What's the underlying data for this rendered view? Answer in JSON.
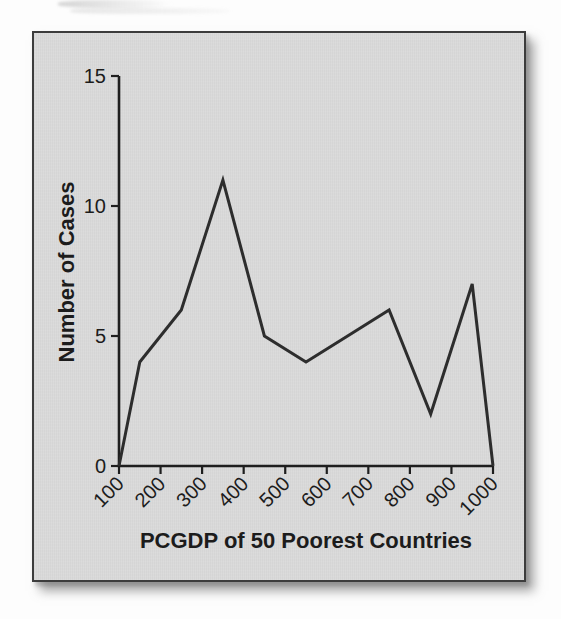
{
  "figure": {
    "panel_bg": "#dadada",
    "border_color": "#3c3c3c",
    "line_color": "#2d2d2d",
    "axis_color": "#1e1e1e",
    "text_color": "#1c1c1c"
  },
  "chart_data": {
    "type": "line",
    "variant": "frequency-polygon",
    "title": "",
    "xlabel": "PCGDP of 50 Poorest Countries",
    "ylabel": "Number of Cases",
    "x": [
      100,
      150,
      250,
      350,
      450,
      550,
      650,
      750,
      850,
      950,
      1000
    ],
    "values": [
      0,
      4,
      6,
      11,
      5,
      4,
      5,
      6,
      2,
      7,
      0
    ],
    "xticks": [
      "100",
      "200",
      "300",
      "400",
      "500",
      "600",
      "700",
      "800",
      "900",
      "1000"
    ],
    "yticks": [
      "0",
      "5",
      "10",
      "15"
    ],
    "xlim": [
      100,
      1000
    ],
    "ylim": [
      0,
      15
    ],
    "grid": false,
    "legend_position": "none"
  }
}
